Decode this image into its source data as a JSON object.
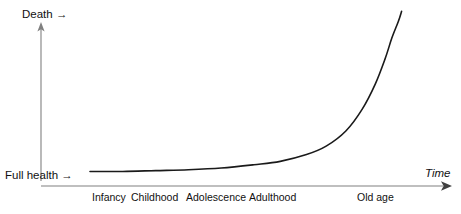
{
  "chart_data": {
    "type": "line",
    "title": "",
    "subtitle": "",
    "xlabel": "Time",
    "ylabel": "",
    "grid": false,
    "legend": null,
    "y_axis": {
      "low_label": "Full health",
      "high_label": "Death",
      "low_arrow": "→",
      "high_arrow": "→",
      "axis_arrow": "up",
      "ticks": [],
      "ylim": [
        0,
        1
      ]
    },
    "x_axis": {
      "label": "Time",
      "label_style": "italic",
      "axis_arrow": "right",
      "categories": [
        "Infancy",
        "Childhood",
        "Adolescence",
        "Adulthood",
        "Old age"
      ],
      "xlim": [
        0,
        1
      ]
    },
    "series": [
      {
        "name": "Health decline over lifespan",
        "description": "Flat near full health through infancy, childhood, adolescence and adulthood, then rising sharply to death in old age",
        "x": [
          0.0,
          0.1,
          0.2,
          0.3,
          0.4,
          0.5,
          0.58,
          0.66,
          0.72,
          0.78,
          0.83,
          0.87,
          0.9,
          0.92,
          0.94,
          0.95
        ],
        "y": [
          0.03,
          0.03,
          0.035,
          0.04,
          0.05,
          0.07,
          0.09,
          0.13,
          0.18,
          0.27,
          0.4,
          0.55,
          0.7,
          0.82,
          0.92,
          0.98
        ],
        "color": "#1a1a1a",
        "linewidth": 1.6
      }
    ],
    "colors": {
      "curve": "#1a1a1a",
      "axis": "#808080",
      "text": "#111111",
      "background": "#ffffff"
    }
  }
}
